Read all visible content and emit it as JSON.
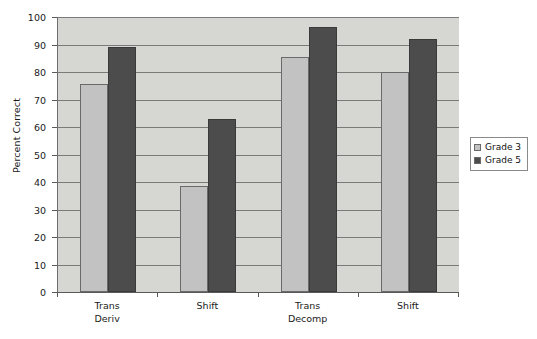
{
  "chart_data": {
    "type": "bar",
    "title": "",
    "xlabel": "",
    "ylabel": "Percent Correct",
    "ylim": [
      0,
      100
    ],
    "ytick_step": 10,
    "yticks": [
      0,
      10,
      20,
      30,
      40,
      50,
      60,
      70,
      80,
      90,
      100
    ],
    "ytick_labels": [
      "0",
      "10",
      "20",
      "30",
      "40",
      "50",
      "60",
      "70",
      "80",
      "90",
      "100"
    ],
    "grid": true,
    "grid_axis": "y",
    "legend_position": "right",
    "categories": [
      "Trans Deriv",
      "Shift",
      "Trans Decomp",
      "Shift"
    ],
    "category_lines": [
      [
        "Trans",
        "Deriv"
      ],
      [
        "Shift",
        ""
      ],
      [
        "Trans",
        "Decomp"
      ],
      [
        "Shift",
        ""
      ]
    ],
    "series": [
      {
        "name": "Grade 3",
        "color": "#c2c2c2",
        "values": [
          75.5,
          38.5,
          85.5,
          80.0
        ]
      },
      {
        "name": "Grade 5",
        "color": "#4c4c4c",
        "values": [
          89.0,
          63.0,
          96.5,
          92.0
        ]
      }
    ],
    "plot_background": "#d6d6d2",
    "gridline_color": "#7a7a7a",
    "axis_color": "#5a5a5a"
  },
  "legend": {
    "entries": [
      {
        "label": "Grade 3"
      },
      {
        "label": "Grade 5"
      }
    ]
  }
}
